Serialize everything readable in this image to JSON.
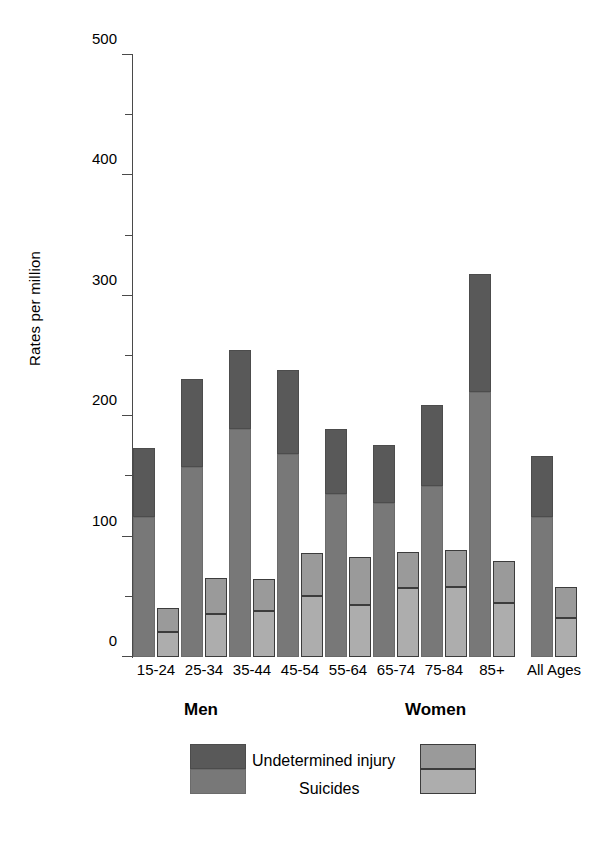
{
  "chart_data": {
    "type": "bar",
    "subtype": "grouped-stacked",
    "title": "",
    "xlabel": "",
    "ylabel": "Rates per million",
    "ylim": [
      0,
      500
    ],
    "yticks": [
      0,
      100,
      200,
      300,
      400,
      500
    ],
    "ytick_labels": [
      "0",
      "100",
      "200",
      "300",
      "400",
      "500"
    ],
    "minor_yticks": [
      50,
      150,
      250,
      350,
      450
    ],
    "grid": false,
    "legend_position": "bottom",
    "categories": [
      "15-24",
      "25-34",
      "35-44",
      "45-54",
      "55-64",
      "65-74",
      "75-84",
      "85+",
      "All Ages"
    ],
    "group_labels": [
      "Men",
      "Women"
    ],
    "segment_labels": [
      "Undetermined injury",
      "Suicides"
    ],
    "series": [
      {
        "name": "Men - Suicides",
        "group": "Men",
        "segment": "Suicides",
        "color": "#787878",
        "values": [
          116,
          158,
          189,
          169,
          135,
          128,
          142,
          220,
          116
        ]
      },
      {
        "name": "Men - Undetermined injury",
        "group": "Men",
        "segment": "Undetermined injury",
        "color": "#595959",
        "values": [
          58,
          73,
          66,
          69,
          54,
          48,
          67,
          98,
          51
        ]
      },
      {
        "name": "Women - Suicides",
        "group": "Women",
        "segment": "Suicides",
        "color": "#adadad",
        "values": [
          21,
          36,
          38,
          51,
          43,
          57,
          58,
          45,
          32
        ]
      },
      {
        "name": "Women - Undetermined injury",
        "group": "Women",
        "segment": "Undetermined injury",
        "color": "#9a9a9a",
        "values": [
          20,
          30,
          27,
          35,
          40,
          30,
          31,
          35,
          26
        ]
      }
    ],
    "totals": {
      "men": [
        174,
        231,
        255,
        238,
        189,
        176,
        209,
        318,
        167
      ],
      "women": [
        41,
        66,
        65,
        86,
        83,
        87,
        89,
        80,
        58
      ]
    }
  },
  "axis": {
    "y_label": "Rates per million"
  },
  "legend": {
    "men_title": "Men",
    "women_title": "Women",
    "undetermined_label": "Undetermined injury",
    "suicides_label": "Suicides"
  }
}
